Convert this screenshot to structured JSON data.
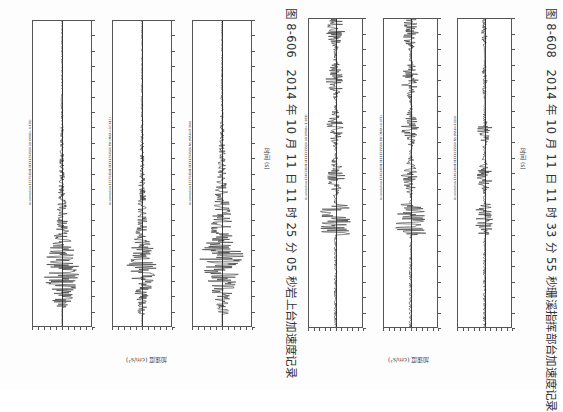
{
  "page": {
    "orientation": "rotated-90",
    "background": "#fdfdfd"
  },
  "figures": [
    {
      "id": "8-606",
      "caption": "图 8-606　2014 年 10 月 11 日 11 时 25 分 05 秒岩上台加速度记录",
      "ylabel": "加速度 (cm/s²)",
      "xlabel": "时间 (s)",
      "panels": [
        {
          "title": "Acceleration 13370414101111250514 UD (MAX=-4.435)",
          "envelope_start": 0.68,
          "peak_pos": 0.82,
          "style": "dense-early"
        },
        {
          "title": "Acceleration 13370414101111250514 EW (MAX=-12.612)",
          "envelope_start": 0.7,
          "peak_pos": 0.8,
          "style": "medium"
        },
        {
          "title": "Acceleration 13370414101111250514 NS (MAX=8.366)",
          "envelope_start": 0.7,
          "peak_pos": 0.78,
          "style": "wide"
        }
      ]
    },
    {
      "id": "8-608",
      "caption": "图 8-608　2014 年 10 月 11 日 11 时 33 分 55 秒珊溪指挥部台加速度记录",
      "ylabel": "加速度 (cm/s²)",
      "xlabel": "时间 (s)",
      "panels": [
        {
          "title": "Acceleration 13403414101111335514 UD (MAX=-1.981)",
          "envelope_start": 0.6,
          "peak_pos": 0.62,
          "style": "long"
        },
        {
          "title": "Acceleration 13403414101111335514 EW (MAX=1.473)",
          "envelope_start": 0.6,
          "peak_pos": 0.5,
          "style": "long"
        },
        {
          "title": "Acceleration 13403414101111335514 NS (MAX=1.110)",
          "envelope_start": 0.6,
          "peak_pos": 0.5,
          "style": "short"
        }
      ]
    }
  ]
}
